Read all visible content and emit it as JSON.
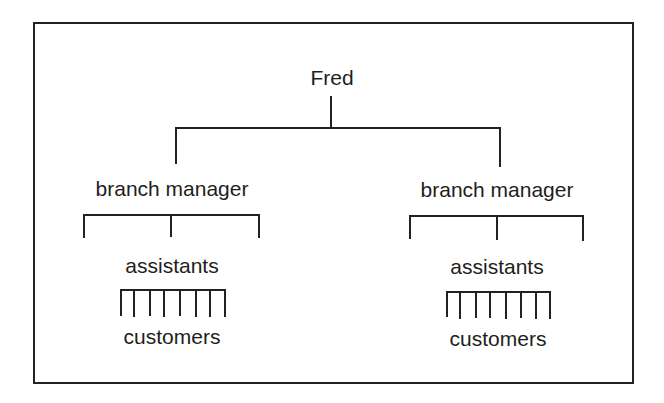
{
  "diagram": {
    "root": {
      "label": "Fred"
    },
    "branches": [
      {
        "label": "branch manager",
        "assistants_label": "assistants",
        "assistant_count": 3,
        "customers_label": "customers",
        "customer_count": 8
      },
      {
        "label": "branch manager",
        "assistants_label": "assistants",
        "assistant_count": 3,
        "customers_label": "customers",
        "customer_count": 8
      }
    ],
    "colors": {
      "line": "#222222",
      "text": "#1e1e1e",
      "background": "#ffffff"
    }
  }
}
